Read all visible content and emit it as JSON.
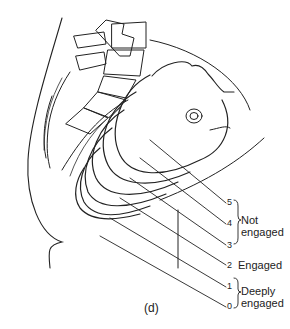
{
  "figure": {
    "caption": "(d)",
    "stations": [
      {
        "number": "5",
        "group": "not_engaged"
      },
      {
        "number": "4",
        "group": "not_engaged"
      },
      {
        "number": "3",
        "group": "not_engaged"
      },
      {
        "number": "2",
        "group": "engaged"
      },
      {
        "number": "1",
        "group": "deeply_engaged"
      },
      {
        "number": "0",
        "group": "deeply_engaged"
      }
    ],
    "labels": {
      "not_engaged_line1": "Not",
      "not_engaged_line2": "engaged",
      "engaged": "Engaged",
      "deeply_engaged_line1": "Deeply",
      "deeply_engaged_line2": "engaged"
    }
  }
}
